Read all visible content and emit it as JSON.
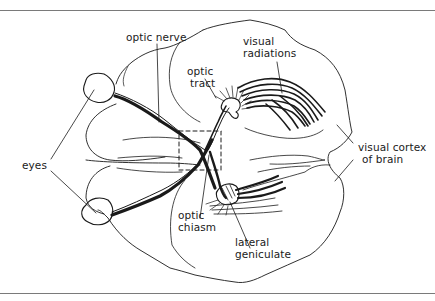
{
  "figure": {
    "type": "anatomical diagram",
    "labels": {
      "optic_nerve": "optic nerve",
      "optic_tract_line1": "optic",
      "optic_tract_line2": "tract",
      "visual_radiations_line1": "visual",
      "visual_radiations_line2": "radiations",
      "eyes": "eyes",
      "visual_cortex_line1": "visual cortex",
      "visual_cortex_line2": "of brain",
      "optic_chiasm_line1": "optic",
      "optic_chiasm_line2": "chiasm",
      "lateral_geniculate_line1": "lateral",
      "lateral_geniculate_line2": "geniculate"
    },
    "colors": {
      "ink": "#1a1a1a",
      "rule": "#7a7a7a",
      "background": "#ffffff"
    }
  }
}
